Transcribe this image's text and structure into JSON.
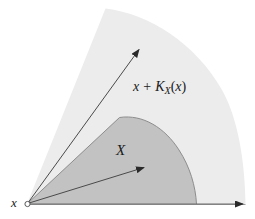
{
  "figure": {
    "type": "geometric-diagram",
    "background_color": "#ffffff",
    "width": 255,
    "height": 219,
    "regions": [
      {
        "name": "outer-cone",
        "label": "x + K_X(x)",
        "fill_color": "#ececec",
        "description": "Light gray circular sector (tangent cone translated to x)"
      },
      {
        "name": "inner-set",
        "label": "X",
        "fill_color": "#c2c2c2",
        "description": "Darker gray convex set with rounded boundary"
      }
    ],
    "vertex": {
      "name": "x",
      "marker": "open-circle",
      "x": 27,
      "y": 204
    },
    "arrows": [
      {
        "name": "upper-ray",
        "from": [
          27,
          204
        ],
        "to": [
          140,
          48
        ]
      },
      {
        "name": "middle-ray",
        "from": [
          27,
          204
        ],
        "to": [
          146,
          167
        ]
      },
      {
        "name": "baseline-ray",
        "from": [
          27,
          204
        ],
        "to": [
          246,
          204
        ]
      }
    ],
    "stroke_color": "#6f6f6f",
    "arrow_color": "#2a2a2a"
  },
  "labels": {
    "origin": "x",
    "inner_set": "X",
    "outer_cone": {
      "term1": "x",
      "operator": "+",
      "func": "K",
      "subscript": "X",
      "open_paren": "(",
      "arg": "x",
      "close_paren": ")",
      "full_text": "x + K_X(x)"
    }
  }
}
